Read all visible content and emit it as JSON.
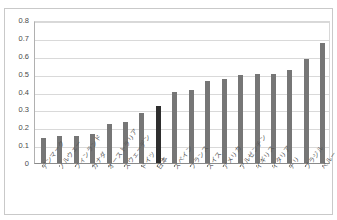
{
  "title": {
    "text": "",
    "visible_fragment": ""
  },
  "chart_data": {
    "type": "bar",
    "title": "",
    "xlabel": "",
    "ylabel": "",
    "ylim": [
      0,
      0.8
    ],
    "ytick_values": [
      0.8,
      0.7,
      0.6,
      0.5,
      0.4,
      0.3,
      0.2,
      0.1,
      0
    ],
    "ytick_labels": [
      "0.8",
      "0.7",
      "0.6",
      "0.5",
      "0.4",
      "0.3",
      "0.2",
      "0.1",
      "0"
    ],
    "grid": true,
    "legend": false,
    "highlight_category": "日本",
    "bar_color": "#767676",
    "highlight_color": "#2e2e2e",
    "categories": [
      "デンマーク",
      "ノルウェー",
      "フィンランド",
      "カナダ",
      "オーストラリア",
      "スウェーデン",
      "ドイツ",
      "日本",
      "スペイン",
      "フランス",
      "スイス",
      "アメリカ",
      "アルゼンチン",
      "イギリス",
      "イタリア",
      "チリ",
      "ブラジル",
      "ペルー"
    ],
    "values": [
      0.14,
      0.15,
      0.15,
      0.16,
      0.22,
      0.23,
      0.28,
      0.32,
      0.4,
      0.41,
      0.46,
      0.47,
      0.49,
      0.5,
      0.5,
      0.52,
      0.58,
      0.67
    ]
  }
}
